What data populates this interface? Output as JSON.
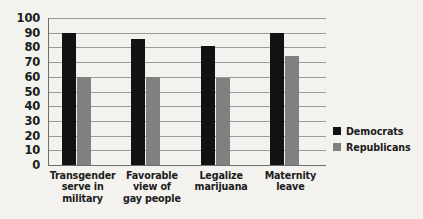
{
  "chart_data": {
    "type": "bar",
    "title": "",
    "xlabel": "",
    "ylabel": "",
    "ylim": [
      0,
      100
    ],
    "yticks": [
      0,
      10,
      20,
      30,
      40,
      50,
      60,
      70,
      80,
      90,
      100
    ],
    "grid": true,
    "legend_position": "right",
    "categories": [
      "Transgender serve in military",
      "Favorable view of gay people",
      "Legalize marijuana",
      "Maternity leave"
    ],
    "category_lines": [
      [
        "Transgender",
        "serve in",
        "military"
      ],
      [
        "Favorable",
        "view of",
        "gay people"
      ],
      [
        "Legalize",
        "marijuana"
      ],
      [
        "Maternity",
        "leave"
      ]
    ],
    "series": [
      {
        "name": "Democrats",
        "color": "#121212",
        "values": [
          90,
          86,
          81,
          90
        ]
      },
      {
        "name": "Republicans",
        "color": "#808080",
        "values": [
          60,
          60,
          59,
          74
        ]
      }
    ]
  },
  "legend": {
    "items": [
      {
        "label": "Democrats",
        "color": "#121212"
      },
      {
        "label": "Republicans",
        "color": "#808080"
      }
    ]
  },
  "axis": {
    "y_tick_labels": [
      "100",
      "90",
      "80",
      "70",
      "60",
      "50",
      "40",
      "30",
      "20",
      "10",
      "0"
    ]
  }
}
